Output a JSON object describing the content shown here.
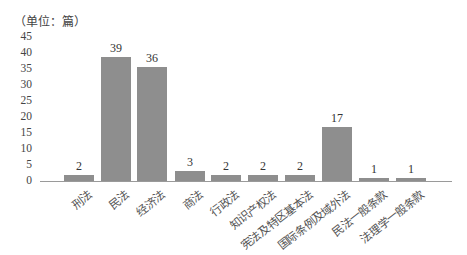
{
  "chart_data": {
    "type": "bar",
    "title": "",
    "unit_label": "（单位：篇）",
    "xlabel": "",
    "ylabel": "篇",
    "ylim": [
      0,
      45
    ],
    "yticks": [
      "0",
      "5",
      "10",
      "15",
      "20",
      "25",
      "30",
      "35",
      "40",
      "45"
    ],
    "grid": false,
    "legend": null,
    "categories": [
      "刑法",
      "民法",
      "经济法",
      "商法",
      "行政法",
      "知识产权法",
      "宪法及特区基本法",
      "国际条例及域外法",
      "民法一般条款",
      "法理学一般条款"
    ],
    "values": [
      2,
      39,
      36,
      3,
      2,
      2,
      2,
      17,
      1,
      1
    ],
    "value_labels": [
      "2",
      "39",
      "36",
      "3",
      "2",
      "2",
      "2",
      "17",
      "1",
      "1"
    ],
    "bar_color": "#8e8e8e"
  }
}
